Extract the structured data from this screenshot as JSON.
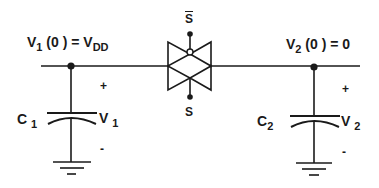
{
  "diagram": {
    "type": "switched-capacitor charge sharing circuit",
    "colors": {
      "line": "#1a1a1a",
      "background": "#ffffff"
    },
    "labels": {
      "v1_initial": {
        "main": "V",
        "sub": "1",
        "rest": "(0 ) = V",
        "sub2": "DD"
      },
      "v2_initial": {
        "main": "V",
        "sub": "2",
        "rest": "(0 ) = 0"
      },
      "switch_bar": "S",
      "switch": "S",
      "c1": {
        "main": "C",
        "sub": "1"
      },
      "c2": {
        "main": "C",
        "sub": "2"
      },
      "v1": {
        "main": "V",
        "sub": "1"
      },
      "v2": {
        "main": "V",
        "sub": "2"
      },
      "plus1": "+",
      "minus1": "-",
      "plus2": "+",
      "minus2": "-"
    },
    "components": [
      {
        "id": "C1",
        "kind": "capacitor",
        "voltage": "V1"
      },
      {
        "id": "C2",
        "kind": "capacitor",
        "voltage": "V2"
      },
      {
        "id": "S",
        "kind": "transmission-gate switch",
        "controls": [
          "S",
          "S-bar"
        ]
      }
    ]
  }
}
